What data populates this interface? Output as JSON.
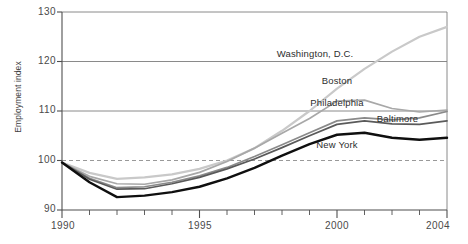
{
  "chart_data": {
    "type": "line",
    "title": "",
    "subtitle": "",
    "xlabel": "",
    "ylabel": "Employment index",
    "xlim": [
      1990,
      2004
    ],
    "ylim": [
      90,
      130
    ],
    "yticks": [
      90,
      100,
      110,
      120,
      130
    ],
    "xticks": [
      1990,
      1991,
      1992,
      1993,
      1994,
      1995,
      1996,
      1997,
      1998,
      1999,
      2000,
      2001,
      2002,
      2003,
      2004
    ],
    "xtick_labels_shown": [
      "1990",
      "1995",
      "2000",
      "2004"
    ],
    "grid": "horizontal",
    "baseline": 100,
    "baseline_style": "dashed",
    "legend": "inline-annotations",
    "x": [
      1990,
      1991,
      1992,
      1993,
      1994,
      1995,
      1996,
      1997,
      1998,
      1999,
      2000,
      2001,
      2002,
      2003,
      2004
    ],
    "series": [
      {
        "name": "Washington, D.C.",
        "color": "#c9c9c9",
        "values": [
          99.6,
          97.5,
          96.3,
          96.6,
          97.2,
          98.3,
          100.0,
          102.5,
          106.0,
          110.0,
          114.5,
          118.5,
          122.0,
          125.0,
          127.0
        ]
      },
      {
        "name": "Boston",
        "color": "#a8a8a8",
        "values": [
          99.6,
          96.8,
          95.3,
          95.2,
          96.1,
          97.6,
          99.8,
          102.5,
          105.5,
          108.5,
          112.0,
          112.2,
          110.5,
          109.8,
          110.2
        ]
      },
      {
        "name": "Philadelphia",
        "color": "#8a8a8a",
        "values": [
          99.6,
          96.4,
          94.5,
          94.7,
          95.6,
          96.9,
          98.6,
          100.8,
          103.2,
          105.6,
          108.0,
          108.6,
          108.2,
          108.6,
          109.9
        ]
      },
      {
        "name": "Baltimore",
        "color": "#5a5a5a",
        "values": [
          99.6,
          96.2,
          94.2,
          94.3,
          95.3,
          96.6,
          98.3,
          100.3,
          102.6,
          105.0,
          107.3,
          108.0,
          107.4,
          107.3,
          108.0
        ]
      },
      {
        "name": "New York",
        "color": "#0f0f0f",
        "values": [
          99.6,
          95.6,
          92.6,
          92.9,
          93.6,
          94.7,
          96.4,
          98.5,
          101.0,
          103.3,
          105.2,
          105.6,
          104.6,
          104.2,
          104.6
        ]
      }
    ],
    "annotations": [
      {
        "text": "Washington, D.C.",
        "x": 1999.2,
        "y": 121.5
      },
      {
        "text": "Boston",
        "x": 2000.0,
        "y": 116.0
      },
      {
        "text": "Philadelphia",
        "x": 2000.0,
        "y": 111.6
      },
      {
        "text": "Baltimore",
        "x": 2002.2,
        "y": 108.4
      },
      {
        "text": "New York",
        "x": 2000.0,
        "y": 103.2
      }
    ]
  },
  "axes": {
    "y_title": "Employment index",
    "y_ticks": [
      "130",
      "120",
      "110",
      "100",
      "90"
    ],
    "x_ticks": [
      "1990",
      "1995",
      "2000",
      "2004"
    ]
  },
  "colors": {
    "washington": "#c9c9c9",
    "boston": "#a8a8a8",
    "philadelphia": "#8a8a8a",
    "baltimore": "#5a5a5a",
    "newyork": "#0f0f0f",
    "grid": "#7d7d7d",
    "axis": "#4f4f4f",
    "text": "#3a3a3a"
  }
}
